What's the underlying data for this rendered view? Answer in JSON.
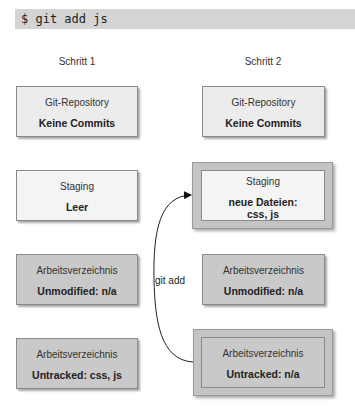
{
  "command": "$ git add js",
  "columns": [
    {
      "label": "Schritt 1",
      "boxes": [
        {
          "title": "Git-Repository",
          "value": "Keine Commits"
        },
        {
          "title": "Staging",
          "value": "Leer"
        },
        {
          "title": "Arbeitsverzeichnis",
          "value": "Unmodified: n/a"
        },
        {
          "title": "Arbeitsverzeichnis",
          "value": "Untracked: css, js"
        }
      ]
    },
    {
      "label": "Schritt 2",
      "boxes": [
        {
          "title": "Git-Repository",
          "value": "Keine Commits"
        },
        {
          "title": "Staging",
          "value": "neue Dateien:",
          "value2": "css, js"
        },
        {
          "title": "Arbeitsverzeichnis",
          "value": "Unmodified: n/a"
        },
        {
          "title": "Arbeitsverzeichnis",
          "value": "Untracked: n/a"
        }
      ]
    }
  ],
  "edge": {
    "label": "git add",
    "from": "Schritt 2 Untracked",
    "to": "Schritt 2 Staging"
  },
  "colors": {
    "command_bg": "#d4d4d4",
    "repo_box": "#ececec",
    "staging_box": "#f4f4f4",
    "workdir_box": "#c9c9c9",
    "highlight_frame": "#c4c4c4"
  }
}
